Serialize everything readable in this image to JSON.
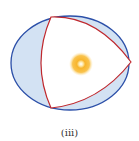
{
  "figure": {
    "label": "(iii)",
    "colors": {
      "ellipse_stroke": "#2b4fa8",
      "ellipse_fill": "#cfdff2",
      "triangle_stroke": "#c0282d",
      "triangle_fill": "#ffffff",
      "sun_outer": "#f7b733",
      "sun_glow": "#fde3a0",
      "sun_center": "#ffffff"
    }
  }
}
